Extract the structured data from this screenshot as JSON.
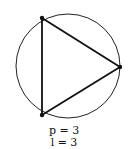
{
  "diagram": {
    "circle": {
      "cx": 68,
      "cy": 66,
      "r": 52
    },
    "vertices": [
      {
        "x": 42,
        "y": 18
      },
      {
        "x": 120,
        "y": 67
      },
      {
        "x": 42,
        "y": 115
      }
    ],
    "colors": {
      "stroke": "#111111",
      "background": "#ffffff"
    }
  },
  "labels": {
    "points": "p = 3",
    "lines": "l = 3"
  }
}
